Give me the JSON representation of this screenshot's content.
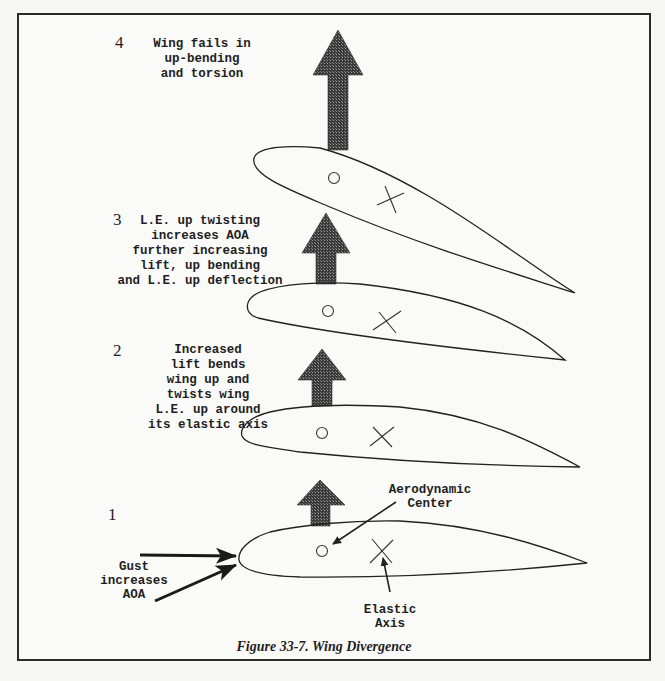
{
  "figure": {
    "caption": "Figure 33-7. Wing Divergence",
    "stages": [
      {
        "number": "1",
        "lines": []
      },
      {
        "number": "2",
        "lines": [
          "Increased",
          "lift bends",
          "wing up and",
          "twists wing",
          "L.E. up around",
          "its elastic axis"
        ]
      },
      {
        "number": "3",
        "lines": [
          "L.E. up twisting",
          "increases AOA",
          "further increasing",
          "lift, up bending",
          "and L.E. up deflection"
        ]
      },
      {
        "number": "4",
        "lines": [
          "Wing fails in",
          "up-bending",
          "and torsion"
        ]
      }
    ],
    "labels": {
      "aerodynamic_center": [
        "Aerodynamic",
        "Center"
      ],
      "elastic_axis": [
        "Elastic",
        "Axis"
      ],
      "gust": [
        "Gust",
        "increases",
        "AOA"
      ]
    },
    "symbols": {
      "aerodynamic_center_marker": "circle",
      "elastic_axis_marker": "x-cross",
      "lift_arrow": "up-arrow-dithered"
    },
    "colors": {
      "line": "#222222",
      "arrow_fill": "#555555",
      "background": "#fafaf8"
    }
  }
}
